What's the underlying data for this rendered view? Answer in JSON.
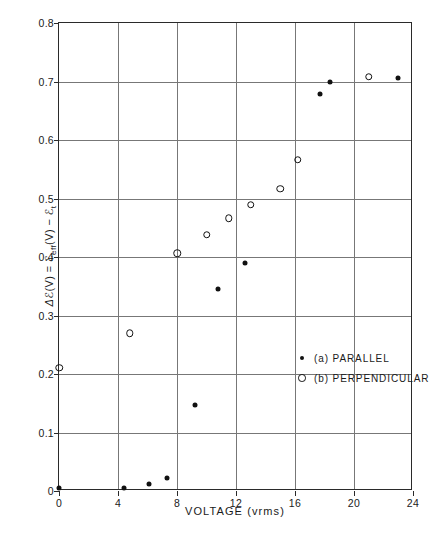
{
  "chart_data": {
    "type": "scatter",
    "title": "",
    "xlabel": "VOLTAGE (vrms)",
    "ylabel": "Δℰ(V) = ℰeff(V) − ℰt",
    "ylabel_parts": {
      "delta": "Δ",
      "eps1": "ℰ",
      "arg1": "(V) = ",
      "eps2": "ℰ",
      "sub2": "eff",
      "arg2": "(V)",
      "minus": " − ",
      "eps3": "ℰ",
      "sub3": "t"
    },
    "xlim": [
      0,
      24
    ],
    "ylim": [
      0,
      0.8
    ],
    "xticks": [
      0,
      4,
      8,
      12,
      16,
      20,
      24
    ],
    "xtick_labels": [
      "0",
      "4",
      "8",
      "12",
      "16",
      "20",
      "24"
    ],
    "yticks": [
      0,
      0.1,
      0.2,
      0.3,
      0.4,
      0.5,
      0.6,
      0.7,
      0.8
    ],
    "ytick_labels": [
      "0",
      "0.1",
      "0.2",
      "0.3",
      "0.4",
      "0.5",
      "0.6",
      "0.7",
      "0.8"
    ],
    "grid": true,
    "grid_color": "#777777",
    "legend_position": "center-right",
    "series": [
      {
        "name": "(a) PARALLEL",
        "key": "parallel",
        "marker": "filled-circle",
        "color": "#111111",
        "points": [
          {
            "x": 0.0,
            "y": 0.005
          },
          {
            "x": 4.4,
            "y": 0.005
          },
          {
            "x": 6.1,
            "y": 0.012
          },
          {
            "x": 7.3,
            "y": 0.022
          },
          {
            "x": 9.2,
            "y": 0.147
          },
          {
            "x": 10.8,
            "y": 0.346
          },
          {
            "x": 12.6,
            "y": 0.389
          },
          {
            "x": 17.7,
            "y": 0.678
          },
          {
            "x": 18.4,
            "y": 0.7
          },
          {
            "x": 23.0,
            "y": 0.706
          }
        ]
      },
      {
        "name": "(b) PERPENDICULAR",
        "key": "perpendicular",
        "marker": "open-circle",
        "color": "#111111",
        "points": [
          {
            "x": 0.0,
            "y": 0.211
          },
          {
            "x": 4.8,
            "y": 0.27
          },
          {
            "x": 8.0,
            "y": 0.406
          },
          {
            "x": 10.0,
            "y": 0.438
          },
          {
            "x": 11.5,
            "y": 0.466
          },
          {
            "x": 13.0,
            "y": 0.489
          },
          {
            "x": 15.0,
            "y": 0.517
          },
          {
            "x": 16.2,
            "y": 0.566
          },
          {
            "x": 21.0,
            "y": 0.708
          }
        ]
      }
    ]
  },
  "legend": {
    "items": [
      {
        "label": "(a) PARALLEL",
        "marker": "filled-circle"
      },
      {
        "label": "(b) PERPENDICULAR",
        "marker": "open-circle"
      }
    ]
  }
}
